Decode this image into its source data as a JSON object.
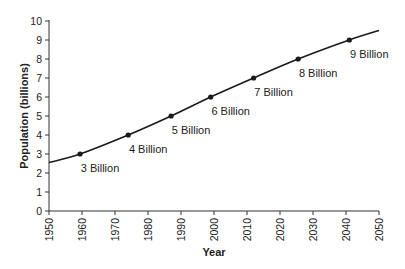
{
  "chart_data": {
    "type": "line",
    "title": "",
    "xlabel": "Year",
    "ylabel": "Population (billions)",
    "xlim": [
      1950,
      2050
    ],
    "ylim": [
      0,
      10
    ],
    "grid": false,
    "legend": null,
    "x_ticks": [
      "1950",
      "1960",
      "1970",
      "1980",
      "1990",
      "2000",
      "2010",
      "2020",
      "2030",
      "2040",
      "2050"
    ],
    "y_ticks": [
      "0",
      "1",
      "2",
      "3",
      "4",
      "5",
      "6",
      "7",
      "8",
      "9",
      "10"
    ],
    "series": [
      {
        "name": "World population",
        "color": "#1a1a1a",
        "curve": [
          {
            "x": 1950,
            "y": 2.55
          },
          {
            "x": 1959.4,
            "y": 3.0
          },
          {
            "x": 1974,
            "y": 4.0
          },
          {
            "x": 1987,
            "y": 5.0
          },
          {
            "x": 1999,
            "y": 6.0
          },
          {
            "x": 2012,
            "y": 7.0
          },
          {
            "x": 2025.5,
            "y": 8.0
          },
          {
            "x": 2041,
            "y": 9.0
          },
          {
            "x": 2050,
            "y": 9.5
          }
        ],
        "markers": [
          {
            "x": 1959.4,
            "y": 3,
            "label": "3 Billion"
          },
          {
            "x": 1974,
            "y": 4,
            "label": "4 Billion"
          },
          {
            "x": 1987,
            "y": 5,
            "label": "5 Billion"
          },
          {
            "x": 1999,
            "y": 6,
            "label": "6 Billion"
          },
          {
            "x": 2012,
            "y": 7,
            "label": "7 Billion"
          },
          {
            "x": 2025.5,
            "y": 8,
            "label": "8 Billion"
          },
          {
            "x": 2041,
            "y": 9,
            "label": "9 Billion"
          }
        ]
      }
    ]
  }
}
